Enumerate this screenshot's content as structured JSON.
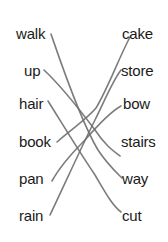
{
  "worksheet": {
    "left_words": [
      "walk",
      "up",
      "hair",
      "book",
      "pan",
      "rain"
    ],
    "right_words": [
      "cake",
      "store",
      "bow",
      "stairs",
      "way",
      "cut"
    ],
    "matches": [
      {
        "left": "walk",
        "right": "way"
      },
      {
        "left": "up",
        "right": "stairs"
      },
      {
        "left": "hair",
        "right": "cut"
      },
      {
        "left": "book",
        "right": "cake"
      },
      {
        "left": "pan",
        "right": "bow"
      },
      {
        "left": "rain",
        "right": "store"
      }
    ],
    "line_color": "#6e6e6e"
  }
}
